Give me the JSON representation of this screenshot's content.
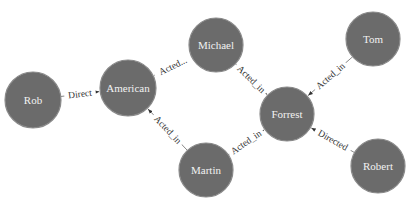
{
  "graph": {
    "node_color": "#6b6b6b",
    "node_stroke": "#8a8a8a",
    "node_text_color": "#f2f2f2",
    "edge_color": "#6a6a6a",
    "nodes": [
      {
        "id": "Rob",
        "label": "Rob",
        "x": 33,
        "y": 100,
        "r": 28
      },
      {
        "id": "American",
        "label": "American",
        "x": 128,
        "y": 88,
        "r": 28
      },
      {
        "id": "Michael",
        "label": "Michael",
        "x": 216,
        "y": 45,
        "r": 27
      },
      {
        "id": "Forrest",
        "label": "Forrest",
        "x": 287,
        "y": 114,
        "r": 27
      },
      {
        "id": "Tom",
        "label": "Tom",
        "x": 373,
        "y": 39,
        "r": 27
      },
      {
        "id": "Martin",
        "label": "Martin",
        "x": 206,
        "y": 170,
        "r": 27
      },
      {
        "id": "Robert",
        "label": "Robert",
        "x": 378,
        "y": 166,
        "r": 27
      }
    ],
    "edges": [
      {
        "source": "Rob",
        "target": "American",
        "label": "Direct"
      },
      {
        "source": "Michael",
        "target": "American",
        "label": "Acted..."
      },
      {
        "source": "Michael",
        "target": "Forrest",
        "label": "Acted_in"
      },
      {
        "source": "Tom",
        "target": "Forrest",
        "label": "Acted_in"
      },
      {
        "source": "Martin",
        "target": "American",
        "label": "Acted_in"
      },
      {
        "source": "Martin",
        "target": "Forrest",
        "label": "Acted_in"
      },
      {
        "source": "Robert",
        "target": "Forrest",
        "label": "Directed"
      }
    ]
  }
}
